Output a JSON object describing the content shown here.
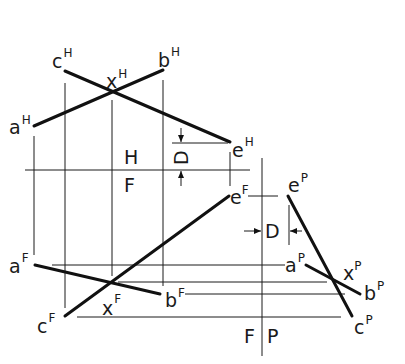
{
  "diagram": {
    "title": "",
    "views": {
      "horizontal": {
        "points": [
          {
            "name": "a",
            "view": "H",
            "x": 34,
            "y": 126
          },
          {
            "name": "c",
            "view": "H",
            "x": 65,
            "y": 70
          },
          {
            "name": "x",
            "view": "H",
            "x": 112,
            "y": 91
          },
          {
            "name": "b",
            "view": "H",
            "x": 163,
            "y": 70
          },
          {
            "name": "e",
            "view": "H",
            "x": 230,
            "y": 142
          }
        ]
      },
      "frontal": {
        "points": [
          {
            "name": "a",
            "view": "F",
            "x": 35,
            "y": 264
          },
          {
            "name": "x",
            "view": "F",
            "x": 112,
            "y": 282
          },
          {
            "name": "b",
            "view": "F",
            "x": 160,
            "y": 294
          },
          {
            "name": "c",
            "view": "F",
            "x": 65,
            "y": 316
          },
          {
            "name": "e",
            "view": "F",
            "x": 229,
            "y": 196
          }
        ]
      },
      "profile": {
        "points": [
          {
            "name": "e",
            "view": "P",
            "x": 288,
            "y": 196
          },
          {
            "name": "a",
            "view": "P",
            "x": 306,
            "y": 265
          },
          {
            "name": "x",
            "view": "P",
            "x": 343,
            "y": 284
          },
          {
            "name": "b",
            "view": "P",
            "x": 360,
            "y": 294
          },
          {
            "name": "c",
            "view": "P",
            "x": 352,
            "y": 316
          }
        ]
      }
    },
    "labels": {
      "aH": {
        "base": "a",
        "sup": "H"
      },
      "cH": {
        "base": "c",
        "sup": "H"
      },
      "xH": {
        "base": "x",
        "sup": "H"
      },
      "bH": {
        "base": "b",
        "sup": "H"
      },
      "eH": {
        "base": "e",
        "sup": "H"
      },
      "aF": {
        "base": "a",
        "sup": "F"
      },
      "xF": {
        "base": "x",
        "sup": "F"
      },
      "bF": {
        "base": "b",
        "sup": "F"
      },
      "cF": {
        "base": "c",
        "sup": "F"
      },
      "eF": {
        "base": "e",
        "sup": "F"
      },
      "eP": {
        "base": "e",
        "sup": "P"
      },
      "aP": {
        "base": "a",
        "sup": "P"
      },
      "xP": {
        "base": "x",
        "sup": "P"
      },
      "bP": {
        "base": "b",
        "sup": "P"
      },
      "cP": {
        "base": "c",
        "sup": "P"
      }
    },
    "fold_lines": {
      "hf": {
        "upper": "H",
        "lower": "F"
      },
      "fp": {
        "left": "F",
        "right": "P"
      }
    },
    "dimension": {
      "label_hf": "D",
      "label_fp": "D"
    },
    "colors": {
      "ink": "#111111",
      "background": "#ffffff"
    }
  }
}
